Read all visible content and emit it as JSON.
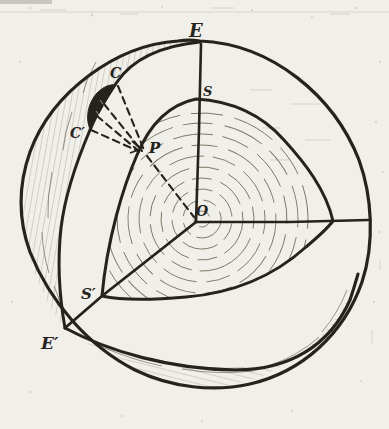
{
  "figure": {
    "labels": {
      "e": "E",
      "s": "S",
      "c": "C",
      "c_prime": "C′",
      "p": "P",
      "o": "O",
      "s_prime": "S′",
      "e_prime": "E′"
    },
    "colors": {
      "ink": "#26231d",
      "paper": "#f1efe9",
      "hatch": "#55503f",
      "rings": "#7b7565"
    }
  }
}
